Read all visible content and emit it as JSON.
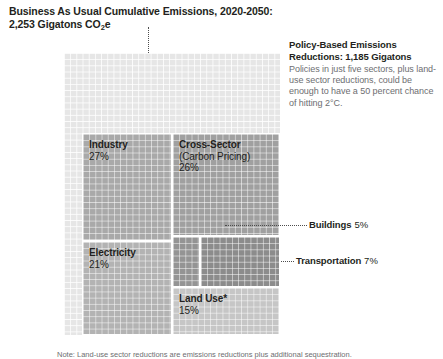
{
  "title": {
    "line1": "Business As Usual Cumulative Emissions, 2020-2050:",
    "line2_pre": "2,253 Gigatons CO",
    "line2_sub": "2",
    "line2_post": "e"
  },
  "policy": {
    "heading": "Policy-Based Emissions Reductions: 1,185 Gigatons",
    "body": "Policies in just five sectors, plus land-use sector reductions, could be enough to have a 50 percent chance of hitting 2°C."
  },
  "footnote": {
    "text": "Note: Land-use sector reductions are emissions reductions plus additional sequestration."
  },
  "chart_data": {
    "type": "treemap",
    "title": "Business As Usual Cumulative Emissions, 2020-2050: 2,253 Gigatons CO2e",
    "total_label": "2,253 Gigatons CO2e",
    "total_value": 2253,
    "units": "Gigatons CO2e",
    "period": "2020-2050",
    "reduction_label": "Policy-Based Emissions Reductions: 1,185 Gigatons",
    "reduction_value": 1185,
    "legend_position": "in-place labels",
    "grid": true,
    "nodes": [
      {
        "id": "industry",
        "name": "Industry",
        "sub": "",
        "pct": 27,
        "pct_label": "27%",
        "color": "#a9a9a9",
        "label_inside": true
      },
      {
        "id": "cross-sector",
        "name": "Cross-Sector",
        "sub": "(Carbon Pricing)",
        "pct": 26,
        "pct_label": "26%",
        "color": "#a0a0a0",
        "label_inside": true
      },
      {
        "id": "electricity",
        "name": "Electricity",
        "sub": "",
        "pct": 21,
        "pct_label": "21%",
        "color": "#b3b3b3",
        "label_inside": true
      },
      {
        "id": "land-use",
        "name": "Land Use*",
        "sub": "",
        "pct": 15,
        "pct_label": "15%",
        "color": "#c6c6c6",
        "label_inside": true
      },
      {
        "id": "transportation",
        "name": "Transportation",
        "sub": "",
        "pct": 7,
        "pct_label": "7%",
        "color": "#8c8c8c",
        "label_inside": false
      },
      {
        "id": "buildings",
        "name": "Buildings",
        "sub": "",
        "pct": 5,
        "pct_label": "5%",
        "color": "#949494",
        "label_inside": false
      }
    ]
  },
  "cells": {
    "industry": {
      "name": "Industry",
      "pct": "27%"
    },
    "crosssector": {
      "name": "Cross-Sector",
      "sub": "(Carbon Pricing)",
      "pct": "26%"
    },
    "electricity": {
      "name": "Electricity",
      "pct": "21%"
    },
    "landuse": {
      "name": "Land Use*",
      "pct": "15%"
    }
  },
  "callouts": {
    "buildings": {
      "name": "Buildings",
      "pct": "5%"
    },
    "transportation": {
      "name": "Transportation",
      "pct": "7%"
    }
  }
}
